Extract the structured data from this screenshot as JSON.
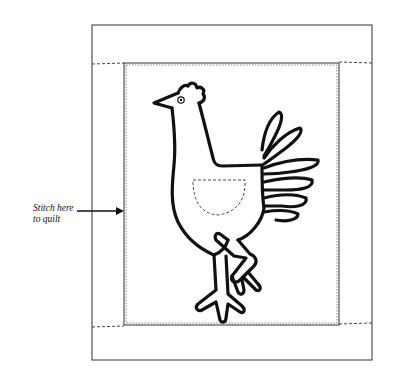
{
  "diagram": {
    "annotation": {
      "line1": "Stitch here",
      "line2": "to quilt"
    },
    "colors": {
      "ink": "#111111",
      "background": "#ffffff",
      "border": "#333333"
    }
  }
}
